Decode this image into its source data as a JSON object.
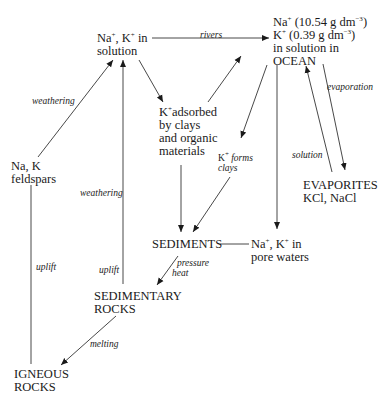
{
  "diagram": {
    "nodes": {
      "solution": {
        "line1": "Na",
        "sup1": "+",
        "mid1": ", K",
        "sup2": "+",
        "end1": " in",
        "line2": "solution"
      },
      "ocean": {
        "l1a": "Na",
        "l1sup": "+",
        "l1b": " (10.54 g dm",
        "l1sup2": "−3",
        "l1c": ")",
        "l2a": "K",
        "l2sup": "+",
        "l2b": " (0.39 g dm",
        "l2sup2": "−3",
        "l2c": ")",
        "l3": "in solution in",
        "l4": "OCEAN"
      },
      "feldspars": {
        "line1": "Na, K",
        "line2": "feldspars"
      },
      "adsorbed": {
        "l1a": "K",
        "l1sup": "+",
        "l1b": "adsorbed",
        "l2": "by clays",
        "l3": "and organic",
        "l4": "materials"
      },
      "evaporites": {
        "line1": "EVAPORITES",
        "line2": "KCl, NaCl"
      },
      "sediments": {
        "label": "SEDIMENTS"
      },
      "pore_waters": {
        "l1a": "Na",
        "l1sup": "+",
        "l1b": ", K",
        "l1sup2": "+",
        "l1c": " in",
        "l2": "pore waters"
      },
      "sedimentary_rocks": {
        "line1": "SEDIMENTARY",
        "line2": "ROCKS"
      },
      "igneous_rocks": {
        "line1": "IGNEOUS",
        "line2": "ROCKS"
      }
    },
    "edge_labels": {
      "rivers": "rivers",
      "weathering_1": "weathering",
      "weathering_2": "weathering",
      "evaporation": "evaporation",
      "solution": "solution",
      "k_forms_a": "K",
      "k_forms_sup": "+",
      "k_forms_b": " forms",
      "k_forms_c": "clays",
      "uplift_1": "uplift",
      "uplift_2": "uplift",
      "pressure": "pressure",
      "heat": "heat",
      "melting": "melting"
    }
  }
}
